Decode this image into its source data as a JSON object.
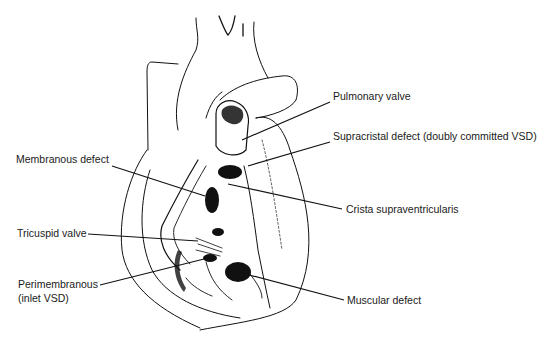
{
  "diagram": {
    "colors": {
      "ink": "#111111",
      "background": "#ffffff",
      "label": "#1a1a1a"
    },
    "labels": [
      {
        "id": "pulmonary-valve",
        "text": "Pulmonary valve",
        "x": 333,
        "y": 96,
        "side": "right"
      },
      {
        "id": "supracristal-defect",
        "text": "Supracristal defect (doubly committed VSD)",
        "x": 333,
        "y": 136,
        "side": "right"
      },
      {
        "id": "membranous-defect",
        "text": "Membranous defect",
        "x": 16,
        "y": 159,
        "side": "left"
      },
      {
        "id": "crista-supraventricularis",
        "text": "Crista supraventricularis",
        "x": 346,
        "y": 202,
        "side": "right"
      },
      {
        "id": "tricuspid-valve",
        "text": "Tricuspid valve",
        "x": 17,
        "y": 228,
        "side": "left"
      },
      {
        "id": "perimembranous",
        "text": "Perimembranous",
        "x": 18,
        "y": 281,
        "side": "left"
      },
      {
        "id": "perimembranous-sub",
        "text": "(inlet VSD)",
        "x": 18,
        "y": 294,
        "side": "left"
      },
      {
        "id": "muscular-defect",
        "text": "Muscular defect",
        "x": 347,
        "y": 294,
        "side": "right"
      }
    ],
    "leaders": [
      {
        "id": "pulmonary-valve",
        "from": [
          330,
          102
        ],
        "to": [
          242,
          140
        ]
      },
      {
        "id": "supracristal-defect",
        "from": [
          330,
          142
        ],
        "to": [
          248,
          166
        ]
      },
      {
        "id": "membranous-defect",
        "from": [
          112,
          166
        ],
        "to": [
          205,
          196
        ]
      },
      {
        "id": "crista-supraventricularis",
        "from": [
          342,
          209
        ],
        "to": [
          228,
          184
        ]
      },
      {
        "id": "tricuspid-valve",
        "from": [
          88,
          234
        ],
        "to": [
          198,
          241
        ]
      },
      {
        "id": "perimembranous",
        "from": [
          100,
          285
        ],
        "to": [
          208,
          258
        ]
      },
      {
        "id": "muscular-defect",
        "from": [
          344,
          300
        ],
        "to": [
          238,
          272
        ]
      }
    ]
  }
}
